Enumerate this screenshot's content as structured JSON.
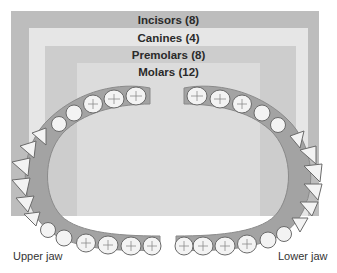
{
  "diagram": {
    "bands": [
      {
        "id": "incisors",
        "label": "Incisors (8)",
        "color": "#bdbdbd"
      },
      {
        "id": "canines",
        "label": "Canines (4)",
        "color": "#e6e6e6"
      },
      {
        "id": "premolars",
        "label": "Premolars (8)",
        "color": "#cdcdcd"
      },
      {
        "id": "molars",
        "label": "Molars (12)",
        "color": "#dcdcdc"
      }
    ],
    "jaw_labels": {
      "upper": "Upper jaw",
      "lower": "Lower jaw"
    },
    "colors": {
      "gum": "#9e9e9e",
      "tooth": "#f2f2f2",
      "tooth_outline": "#6e6e6e",
      "background": "#ffffff"
    }
  }
}
